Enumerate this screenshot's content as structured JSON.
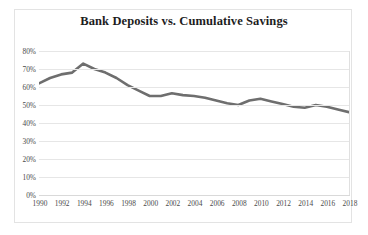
{
  "chart_data": {
    "type": "line",
    "title": "Bank Deposits vs. Cumulative Savings",
    "xlabel": "",
    "ylabel": "",
    "ylim": [
      0,
      80
    ],
    "ytick_labels": [
      "80%",
      "70%",
      "60%",
      "50%",
      "40%",
      "30%",
      "20%",
      "10%",
      "0%"
    ],
    "ytick_values": [
      80,
      70,
      60,
      50,
      40,
      30,
      20,
      10,
      0
    ],
    "xtick_labels": [
      "1990",
      "1992",
      "1994",
      "1996",
      "1998",
      "2000",
      "2002",
      "2004",
      "2006",
      "2008",
      "2010",
      "2012",
      "2014",
      "2016",
      "2018"
    ],
    "grid": true,
    "legend": "none",
    "line_color": "#6e6e6e",
    "x": [
      1990,
      1991,
      1992,
      1993,
      1994,
      1995,
      1996,
      1997,
      1998,
      1999,
      2000,
      2001,
      2002,
      2003,
      2004,
      2005,
      2006,
      2007,
      2008,
      2009,
      2010,
      2011,
      2012,
      2013,
      2014,
      2015,
      2016,
      2017,
      2018
    ],
    "values": [
      62,
      65,
      67,
      68,
      73,
      70,
      68,
      65,
      61,
      58,
      55,
      55,
      56.5,
      55.5,
      55,
      54,
      52.5,
      51,
      50,
      52.5,
      53.5,
      52,
      50.5,
      49,
      48.5,
      50,
      49,
      47.5,
      46
    ]
  }
}
